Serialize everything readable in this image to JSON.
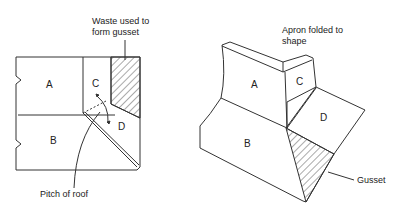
{
  "diagram": {
    "left": {
      "callout_waste": [
        "Waste used to",
        "form gusset"
      ],
      "callout_pitch": "Pitch of roof",
      "parts": {
        "A": "A",
        "B": "B",
        "C": "C",
        "D": "D"
      }
    },
    "right": {
      "callout_apron": [
        "Apron folded to",
        "shape"
      ],
      "callout_gusset": "Gusset",
      "parts": {
        "A": "A",
        "B": "B",
        "C": "C",
        "D": "D"
      }
    },
    "colors": {
      "line": "#333333",
      "hatch": "#555555",
      "background": "#ffffff"
    }
  }
}
